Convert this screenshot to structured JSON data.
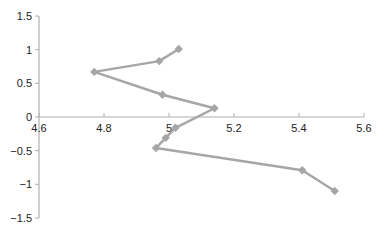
{
  "chart_data": {
    "type": "scatter",
    "title": "",
    "xlabel": "",
    "ylabel": "",
    "xlim": [
      4.6,
      5.6
    ],
    "ylim": [
      -1.5,
      1.5
    ],
    "x_ticks": [
      "4.6",
      "4.8",
      "5",
      "5.2",
      "5.4",
      "5.6"
    ],
    "y_ticks": [
      "1.5",
      "1",
      "0.5",
      "0",
      "−0.5",
      "−1",
      "−1.5"
    ],
    "grid": false,
    "legend": null,
    "series": [
      {
        "name": "Series 1",
        "style": "line-with-diamond-markers",
        "color": "#a6a6a6",
        "x": [
          5.03,
          4.97,
          4.77,
          4.98,
          5.14,
          5.02,
          4.99,
          4.96,
          5.41,
          5.51
        ],
        "y": [
          1.01,
          0.83,
          0.67,
          0.33,
          0.13,
          -0.16,
          -0.31,
          -0.46,
          -0.79,
          -1.1
        ]
      }
    ]
  },
  "colors": {
    "axis": "#b0b0b0",
    "series": "#a6a6a6",
    "text": "#222222"
  }
}
